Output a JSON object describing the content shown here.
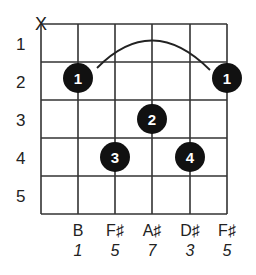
{
  "chord_diagram": {
    "muted_string_marker": "X",
    "fret_labels": [
      "1",
      "2",
      "3",
      "4",
      "5"
    ],
    "strings": [
      {
        "note": "",
        "degree": "",
        "muted": true
      },
      {
        "note": "B",
        "degree": "1"
      },
      {
        "note": "F♯",
        "degree": "5"
      },
      {
        "note": "A♯",
        "degree": "7"
      },
      {
        "note": "D♯",
        "degree": "3"
      },
      {
        "note": "F♯",
        "degree": "5"
      }
    ],
    "fingers": [
      {
        "string": 2,
        "fret": 2,
        "label": "1"
      },
      {
        "string": 6,
        "fret": 2,
        "label": "1"
      },
      {
        "string": 4,
        "fret": 3,
        "label": "2"
      },
      {
        "string": 3,
        "fret": 4,
        "label": "3"
      },
      {
        "string": 5,
        "fret": 4,
        "label": "4"
      }
    ],
    "barre": {
      "from_string": 2,
      "to_string": 6,
      "fret": 2
    },
    "colors": {
      "grid": "#333333",
      "dot": "#111111",
      "dot_text": "#ffffff"
    }
  }
}
